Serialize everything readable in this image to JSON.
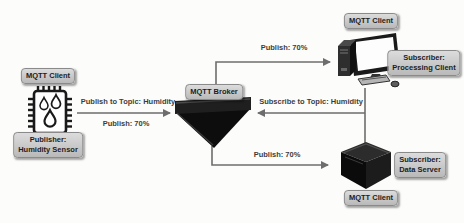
{
  "nodes": {
    "publisher": {
      "client_badge": "MQTT Client",
      "role_line1": "Publisher:",
      "role_line2": "Humidity Sensor",
      "icon": "humidity-sensor-chip-icon"
    },
    "broker": {
      "label": "MQTT Broker",
      "icon": "broker-hopper-icon"
    },
    "processing_client": {
      "client_badge": "MQTT Client",
      "role_line1": "Subscriber:",
      "role_line2": "Processing Client",
      "icon": "desktop-computer-icon"
    },
    "data_server": {
      "client_badge": "MQTT Client",
      "role_line1": "Subscriber:",
      "role_line2": "Data Server",
      "icon": "server-box-icon"
    }
  },
  "edges": {
    "publisher_to_broker": {
      "topic_label": "Publish to Topic: Humidity",
      "value_label": "Publish: 70%"
    },
    "broker_to_processing_client": {
      "value_label": "Publish: 70%"
    },
    "broker_to_data_server": {
      "value_label": "Publish: 70%"
    },
    "subscribers_to_broker": {
      "topic_label": "Subscribe to Topic: Humidity"
    }
  },
  "colors": {
    "background": "#fcfcfb",
    "badge_background": "#c9c9c9",
    "badge_border": "#8a8a8a",
    "connector_line": "#6d6d6d",
    "icon_dark": "#141414",
    "text": "#1d1d1d"
  }
}
